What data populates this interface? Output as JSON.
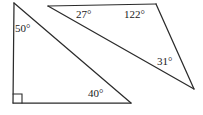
{
  "figure": {
    "background_color": "#ffffff",
    "stroke_color": "#2b2b2b",
    "text_color": "#1a1a1a",
    "width": 203,
    "height": 115,
    "shapes": [
      {
        "name": "left-right-triangle",
        "kind": "triangle",
        "has_right_angle_marker": true,
        "vertices": [
          {
            "name": "apex-top-left",
            "x": 14,
            "y": 3
          },
          {
            "name": "corner-bottom-left",
            "x": 13,
            "y": 103
          },
          {
            "name": "corner-bottom-right",
            "x": 131,
            "y": 103
          }
        ]
      },
      {
        "name": "right-obtuse-triangle",
        "kind": "triangle",
        "has_right_angle_marker": false,
        "vertices": [
          {
            "name": "vertex-top-left",
            "x": 48,
            "y": 6
          },
          {
            "name": "vertex-top-right",
            "x": 156,
            "y": 4
          },
          {
            "name": "vertex-far-right",
            "x": 194,
            "y": 89
          }
        ]
      }
    ],
    "right_angle_marker": {
      "name": "right-angle-square",
      "vertex_x": 13,
      "vertex_y": 103,
      "size": 9
    },
    "angles": [
      {
        "id": "angle-50",
        "label": "50°",
        "value": 50,
        "unit": "degrees",
        "shape": "left-right-triangle",
        "at_vertex": "apex-top-left",
        "x": 15,
        "y": 23
      },
      {
        "id": "angle-40",
        "label": "40°",
        "value": 40,
        "unit": "degrees",
        "shape": "left-right-triangle",
        "at_vertex": "corner-bottom-right",
        "x": 88,
        "y": 88
      },
      {
        "id": "angle-27",
        "label": "27°",
        "value": 27,
        "unit": "degrees",
        "shape": "right-obtuse-triangle",
        "at_vertex": "vertex-top-left",
        "x": 76,
        "y": 9
      },
      {
        "id": "angle-122",
        "label": "122°",
        "value": 122,
        "unit": "degrees",
        "shape": "right-obtuse-triangle",
        "at_vertex": "vertex-top-right",
        "x": 124,
        "y": 9
      },
      {
        "id": "angle-31",
        "label": "31°",
        "value": 31,
        "unit": "degrees",
        "shape": "right-obtuse-triangle",
        "at_vertex": "vertex-far-right",
        "x": 157,
        "y": 56
      }
    ]
  }
}
